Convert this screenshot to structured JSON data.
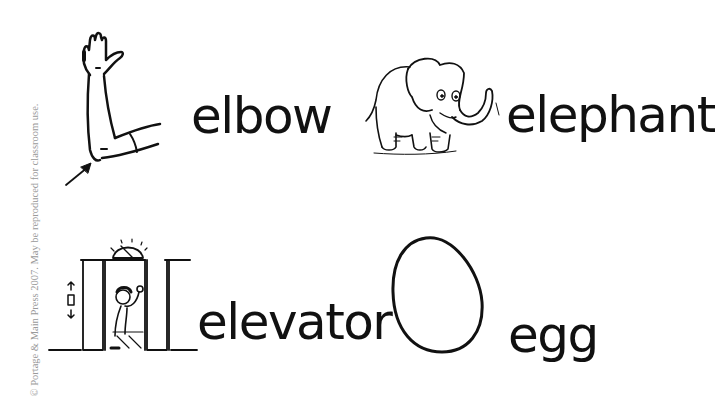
{
  "worksheet": {
    "copyright": "© Portage & Main Press 2007. May be reproduced for classroom use.",
    "items": [
      {
        "word": "elbow",
        "picture": "arm-elbow-icon"
      },
      {
        "word": "elephant",
        "picture": "elephant-icon"
      },
      {
        "word": "elevator",
        "picture": "elevator-icon"
      },
      {
        "word": "egg",
        "picture": "egg-icon"
      }
    ]
  }
}
